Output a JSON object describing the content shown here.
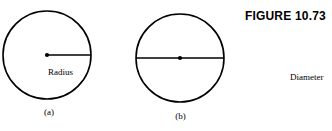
{
  "figure": {
    "title": "FIGURE 10.73",
    "background_color": "#ffffff",
    "stroke_color": "#000000",
    "panels": [
      {
        "id": "a",
        "caption": "(a)",
        "shape": "circle",
        "measure_label": "Radius",
        "segment": "radius",
        "center_dot": true
      },
      {
        "id": "b",
        "caption": "(b)",
        "shape": "circle",
        "measure_label": "Diameter",
        "segment": "diameter",
        "center_dot": true
      }
    ]
  }
}
